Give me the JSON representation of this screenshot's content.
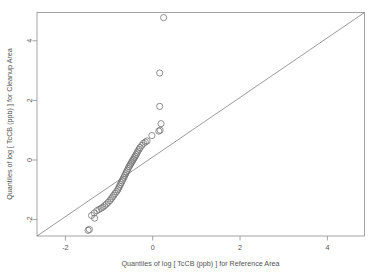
{
  "chart_data": {
    "type": "scatter",
    "title": "",
    "xlabel": "Quantiles of log [ TcCB (ppb) ] for Reference Area",
    "ylabel": "Quantiles of log [ TcCB (ppb) ] for Cleanup Area",
    "xlim": [
      -2.65,
      4.85
    ],
    "ylim": [
      -2.55,
      4.95
    ],
    "xticks": [
      -2,
      0,
      2,
      4
    ],
    "yticks": [
      -2,
      0,
      2,
      4
    ],
    "xticklabels": [
      "-2",
      "0",
      "2",
      "4"
    ],
    "yticklabels": [
      "-2",
      "0",
      "2",
      "4"
    ],
    "grid": false,
    "legend": null,
    "marker": "open-circle",
    "marker_size": 3.1,
    "point_color": "#6b6b6b",
    "line_color": "#6f6f6f",
    "frame_color": "#9a9a9a",
    "background": "#ffffff",
    "reference_line": {
      "label": "y = x",
      "type": "identity",
      "slope": 1,
      "intercept": 0,
      "from": [
        -2.65,
        -2.55
      ],
      "to": [
        4.85,
        4.95
      ]
    },
    "series": [
      {
        "name": "Q-Q points",
        "points": [
          [
            0.25,
            4.78
          ],
          [
            0.16,
            2.92
          ],
          [
            0.16,
            1.8
          ],
          [
            0.19,
            1.22
          ],
          [
            0.17,
            1.0
          ],
          [
            0.14,
            0.97
          ],
          [
            -0.02,
            0.82
          ],
          [
            -0.13,
            0.64
          ],
          [
            -0.17,
            0.6
          ],
          [
            -0.21,
            0.56
          ],
          [
            -0.25,
            0.49
          ],
          [
            -0.29,
            0.42
          ],
          [
            -0.31,
            0.36
          ],
          [
            -0.34,
            0.3
          ],
          [
            -0.36,
            0.24
          ],
          [
            -0.38,
            0.18
          ],
          [
            -0.4,
            0.13
          ],
          [
            -0.42,
            0.08
          ],
          [
            -0.44,
            0.03
          ],
          [
            -0.46,
            -0.02
          ],
          [
            -0.48,
            -0.07
          ],
          [
            -0.5,
            -0.12
          ],
          [
            -0.52,
            -0.17
          ],
          [
            -0.54,
            -0.22
          ],
          [
            -0.56,
            -0.28
          ],
          [
            -0.58,
            -0.34
          ],
          [
            -0.6,
            -0.4
          ],
          [
            -0.62,
            -0.46
          ],
          [
            -0.64,
            -0.52
          ],
          [
            -0.66,
            -0.58
          ],
          [
            -0.68,
            -0.64
          ],
          [
            -0.7,
            -0.7
          ],
          [
            -0.72,
            -0.76
          ],
          [
            -0.74,
            -0.82
          ],
          [
            -0.76,
            -0.88
          ],
          [
            -0.78,
            -0.94
          ],
          [
            -0.8,
            -1.0
          ],
          [
            -0.83,
            -1.06
          ],
          [
            -0.86,
            -1.12
          ],
          [
            -0.89,
            -1.18
          ],
          [
            -0.92,
            -1.24
          ],
          [
            -0.95,
            -1.3
          ],
          [
            -0.98,
            -1.36
          ],
          [
            -1.02,
            -1.42
          ],
          [
            -1.06,
            -1.48
          ],
          [
            -1.1,
            -1.53
          ],
          [
            -1.14,
            -1.58
          ],
          [
            -1.18,
            -1.62
          ],
          [
            -1.23,
            -1.66
          ],
          [
            -1.28,
            -1.7
          ],
          [
            -1.34,
            -1.78
          ],
          [
            -1.4,
            -1.86
          ],
          [
            -1.33,
            -1.95
          ],
          [
            -1.45,
            -2.33
          ],
          [
            -1.48,
            -2.36
          ]
        ]
      }
    ]
  }
}
